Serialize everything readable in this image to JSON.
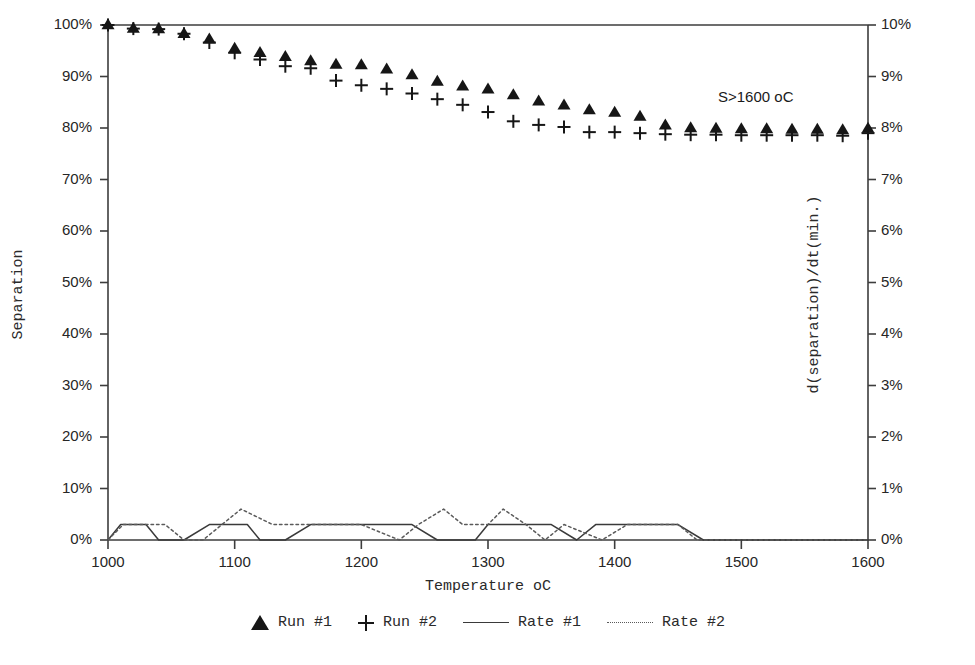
{
  "chart_data": {
    "type": "scatter",
    "title": "",
    "xlabel": "Temperature oC",
    "ylabel": "Separation",
    "ylabel_right": "d(separation)/dt(min.)",
    "xlim": [
      1000,
      1600
    ],
    "ylim": [
      0,
      100
    ],
    "ylim_right": [
      0,
      10
    ],
    "grid": false,
    "legend_position": "bottom",
    "xticks": [
      1000,
      1100,
      1200,
      1300,
      1400,
      1500,
      1600
    ],
    "xticklabels": [
      "1000",
      "1100",
      "1200",
      "1300",
      "1400",
      "1500",
      "1600"
    ],
    "yticks": [
      0,
      10,
      20,
      30,
      40,
      50,
      60,
      70,
      80,
      90,
      100
    ],
    "yticklabels": [
      "0%",
      "10%",
      "20%",
      "30%",
      "40%",
      "50%",
      "60%",
      "70%",
      "80%",
      "90%",
      "100%"
    ],
    "yticks_right": [
      0,
      1,
      2,
      3,
      4,
      5,
      6,
      7,
      8,
      9,
      10
    ],
    "yticklabels_right": [
      "0%",
      "1%",
      "2%",
      "3%",
      "4%",
      "5%",
      "6%",
      "7%",
      "8%",
      "9%",
      "10%"
    ],
    "annotations": [
      {
        "text": "S>1600 oC",
        "x": 1495,
        "y": 91
      }
    ],
    "x": [
      1000,
      1020,
      1040,
      1060,
      1080,
      1100,
      1120,
      1140,
      1160,
      1180,
      1200,
      1220,
      1240,
      1260,
      1280,
      1300,
      1320,
      1340,
      1360,
      1380,
      1400,
      1420,
      1440,
      1460,
      1480,
      1500,
      1520,
      1540,
      1560,
      1580,
      1600
    ],
    "series": [
      {
        "name": "Run #1",
        "marker": "triangle",
        "axis": "left",
        "color": "#161616",
        "values": [
          100.0,
          99.3,
          99.2,
          98.3,
          97.2,
          95.4,
          94.6,
          93.8,
          93.0,
          92.3,
          92.2,
          91.4,
          90.3,
          89.0,
          88.1,
          87.5,
          86.4,
          85.2,
          84.4,
          83.5,
          83.0,
          82.2,
          80.5,
          80.0,
          79.9,
          79.8,
          79.8,
          79.7,
          79.7,
          79.6,
          79.9
        ]
      },
      {
        "name": "Run #2",
        "marker": "plus",
        "axis": "left",
        "color": "#161616",
        "values": [
          100.0,
          99.3,
          99.2,
          98.3,
          96.6,
          94.6,
          93.3,
          92.0,
          91.6,
          89.2,
          88.3,
          87.6,
          86.7,
          85.6,
          84.5,
          83.1,
          81.3,
          80.6,
          80.2,
          79.2,
          79.2,
          79.0,
          78.8,
          78.7,
          78.7,
          78.6,
          78.6,
          78.6,
          78.6,
          78.5,
          79.0
        ]
      },
      {
        "name": "Rate #1",
        "marker": "line-solid",
        "axis": "right",
        "color": "#3a3a3a",
        "x": [
          1000,
          1010,
          1030,
          1040,
          1060,
          1080,
          1110,
          1120,
          1140,
          1160,
          1190,
          1200,
          1240,
          1260,
          1290,
          1300,
          1320,
          1350,
          1370,
          1385,
          1400,
          1420,
          1450,
          1470,
          1600
        ],
        "values": [
          0.0,
          0.3,
          0.3,
          0.0,
          0.0,
          0.3,
          0.3,
          0.0,
          0.0,
          0.3,
          0.3,
          0.3,
          0.3,
          0.0,
          0.0,
          0.3,
          0.3,
          0.3,
          0.0,
          0.3,
          0.3,
          0.3,
          0.3,
          0.0,
          0.0
        ]
      },
      {
        "name": "Rate #2",
        "marker": "line-dotted",
        "axis": "right",
        "color": "#5a5a5a",
        "x": [
          1000,
          1012,
          1045,
          1060,
          1075,
          1090,
          1105,
          1130,
          1150,
          1165,
          1185,
          1200,
          1230,
          1245,
          1265,
          1280,
          1300,
          1312,
          1330,
          1345,
          1360,
          1390,
          1410,
          1430,
          1450,
          1465,
          1600
        ],
        "values": [
          0.0,
          0.3,
          0.3,
          0.0,
          0.0,
          0.3,
          0.6,
          0.3,
          0.3,
          0.3,
          0.3,
          0.3,
          0.0,
          0.3,
          0.6,
          0.3,
          0.3,
          0.6,
          0.3,
          0.0,
          0.3,
          0.0,
          0.3,
          0.3,
          0.3,
          0.0,
          0.0
        ]
      }
    ]
  },
  "legend": {
    "items": [
      {
        "label": "Run #1",
        "marker": "triangle"
      },
      {
        "label": "Run #2",
        "marker": "plus"
      },
      {
        "label": "Rate #1",
        "marker": "line-solid"
      },
      {
        "label": "Rate #2",
        "marker": "line-dotted"
      }
    ]
  }
}
